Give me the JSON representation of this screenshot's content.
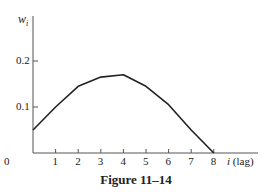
{
  "chart_data": {
    "type": "line",
    "title": "",
    "caption": "Figure 11–14",
    "xlabel": "i (lag)",
    "ylabel": "w_i",
    "x": [
      0,
      1,
      2,
      3,
      4,
      5,
      6,
      7,
      8
    ],
    "series": [
      {
        "name": "w_i",
        "values": [
          0.05,
          0.1,
          0.145,
          0.165,
          0.17,
          0.145,
          0.105,
          0.05,
          0.0
        ]
      }
    ],
    "xticks": [
      "0",
      "1",
      "2",
      "3",
      "4",
      "5",
      "6",
      "7",
      "8"
    ],
    "yticks": [
      "0.1",
      "0.2"
    ],
    "xlim": [
      0,
      9.5
    ],
    "ylim": [
      0,
      0.25
    ],
    "grid": false,
    "legend": "none"
  },
  "labels": {
    "ylabel_main": "w",
    "ylabel_sub": "i",
    "xlabel_var": "i",
    "xlabel_unit": "(lag)",
    "caption": "Figure 11–14"
  }
}
